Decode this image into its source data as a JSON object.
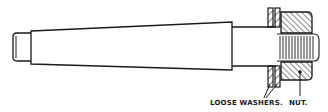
{
  "diagram": {
    "type": "technical-drawing",
    "labels": {
      "washers": "LOOSE WASHERS.",
      "nut": "NUT."
    },
    "colors": {
      "line": "#1a1a1a",
      "background": "#ffffff"
    }
  }
}
